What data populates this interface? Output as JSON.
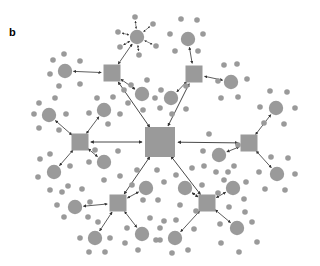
{
  "panel_label": "b",
  "colors": {
    "node": "#9a9a9a",
    "edge": "#333333",
    "background": "#ffffff"
  },
  "diagram": {
    "type": "hierarchical-network",
    "center": {
      "x": 160,
      "y": 142,
      "half": 15
    },
    "hubs": [
      {
        "id": "tl",
        "x": 112,
        "y": 73,
        "half": 8.5
      },
      {
        "id": "tr",
        "x": 194,
        "y": 74,
        "half": 8.5
      },
      {
        "id": "l",
        "x": 80,
        "y": 142,
        "half": 8.5
      },
      {
        "id": "r",
        "x": 249,
        "y": 143,
        "half": 8.5
      },
      {
        "id": "bl",
        "x": 118,
        "y": 203,
        "half": 8.5
      },
      {
        "id": "br",
        "x": 207,
        "y": 203,
        "half": 8.5
      }
    ],
    "clusters": [
      {
        "hub": "tl",
        "x": 137,
        "y": 37,
        "sats": [
          [
            135,
            17
          ],
          [
            153,
            24
          ],
          [
            156,
            46
          ],
          [
            139,
            55
          ],
          [
            120,
            47
          ],
          [
            118,
            32
          ]
        ],
        "arrows": true
      },
      {
        "hub": "tl",
        "x": 65,
        "y": 71,
        "sats": [
          [
            64,
            54
          ],
          [
            80,
            61
          ],
          [
            80,
            84
          ],
          [
            59,
            86
          ],
          [
            50,
            74
          ],
          [
            53,
            60
          ]
        ]
      },
      {
        "hub": "tl",
        "x": 142,
        "y": 94,
        "sats": [
          [
            131,
            85
          ],
          [
            147,
            80
          ],
          [
            155,
            98
          ],
          [
            143,
            110
          ],
          [
            128,
            103
          ],
          [
            124,
            90
          ]
        ]
      },
      {
        "hub": "tr",
        "x": 188,
        "y": 39,
        "sats": [
          [
            181,
            19
          ],
          [
            197,
            20
          ],
          [
            203,
            34
          ],
          [
            198,
            51
          ],
          [
            175,
            51
          ],
          [
            170,
            34
          ]
        ]
      },
      {
        "hub": "tr",
        "x": 231,
        "y": 82,
        "sats": [
          [
            224,
            65
          ],
          [
            237,
            64
          ],
          [
            247,
            79
          ],
          [
            238,
            97
          ],
          [
            221,
            98
          ],
          [
            218,
            81
          ]
        ]
      },
      {
        "hub": "tr",
        "x": 171,
        "y": 98,
        "sats": [
          [
            161,
            90
          ],
          [
            186,
            86
          ],
          [
            186,
            109
          ],
          [
            172,
            114
          ],
          [
            160,
            108
          ]
        ]
      },
      {
        "hub": "l",
        "x": 49,
        "y": 115,
        "sats": [
          [
            39,
            103
          ],
          [
            55,
            98
          ],
          [
            66,
            114
          ],
          [
            59,
            130
          ],
          [
            39,
            128
          ],
          [
            34,
            114
          ]
        ]
      },
      {
        "hub": "l",
        "x": 104,
        "y": 110,
        "sats": [
          [
            97,
            98
          ],
          [
            113,
            97
          ],
          [
            120,
            114
          ],
          [
            108,
            124
          ],
          [
            89,
            113
          ]
        ]
      },
      {
        "hub": "l",
        "x": 54,
        "y": 172,
        "sats": [
          [
            40,
            159
          ],
          [
            50,
            154
          ],
          [
            70,
            166
          ],
          [
            68,
            186
          ],
          [
            50,
            190
          ],
          [
            38,
            177
          ]
        ]
      },
      {
        "hub": "l",
        "x": 104,
        "y": 162,
        "sats": [
          [
            89,
            162
          ],
          [
            95,
            150
          ],
          [
            118,
            151
          ],
          [
            120,
            176
          ],
          [
            104,
            180
          ]
        ]
      },
      {
        "hub": "r",
        "x": 276,
        "y": 108,
        "sats": [
          [
            270,
            91
          ],
          [
            287,
            92
          ],
          [
            295,
            108
          ],
          [
            284,
            124
          ],
          [
            264,
            123
          ],
          [
            260,
            107
          ]
        ]
      },
      {
        "hub": "r",
        "x": 277,
        "y": 174,
        "sats": [
          [
            271,
            157
          ],
          [
            288,
            158
          ],
          [
            295,
            174
          ],
          [
            285,
            190
          ],
          [
            265,
            189
          ],
          [
            259,
            172
          ]
        ]
      },
      {
        "hub": "r",
        "x": 219,
        "y": 155,
        "sats": [
          [
            203,
            151
          ],
          [
            209,
            134
          ],
          [
            238,
            145
          ],
          [
            234,
            166
          ],
          [
            216,
            172
          ],
          [
            204,
            166
          ]
        ]
      },
      {
        "hub": "br",
        "x": 185,
        "y": 188,
        "sats": [
          [
            176,
            175
          ],
          [
            180,
            205
          ],
          [
            196,
            211
          ],
          [
            202,
            185
          ],
          [
            192,
            168
          ]
        ]
      },
      {
        "hub": "br",
        "x": 233,
        "y": 188,
        "sats": [
          [
            228,
            172
          ],
          [
            246,
            182
          ],
          [
            244,
            199
          ],
          [
            229,
            207
          ],
          [
            218,
            193
          ],
          [
            224,
            180
          ]
        ]
      },
      {
        "hub": "br",
        "x": 175,
        "y": 238,
        "sats": [
          [
            164,
            221
          ],
          [
            176,
            220
          ],
          [
            194,
            229
          ],
          [
            188,
            250
          ],
          [
            172,
            253
          ],
          [
            160,
            240
          ]
        ]
      },
      {
        "hub": "br",
        "x": 237,
        "y": 228,
        "sats": [
          [
            220,
            224
          ],
          [
            221,
            243
          ],
          [
            239,
            252
          ],
          [
            257,
            242
          ],
          [
            252,
            222
          ],
          [
            245,
            212
          ]
        ]
      },
      {
        "hub": "bl",
        "x": 146,
        "y": 188,
        "sats": [
          [
            132,
            185
          ],
          [
            137,
            170
          ],
          [
            157,
            170
          ],
          [
            158,
            200
          ],
          [
            143,
            200
          ],
          [
            164,
            182
          ]
        ]
      },
      {
        "hub": "bl",
        "x": 75,
        "y": 207,
        "sats": [
          [
            62,
            192
          ],
          [
            82,
            189
          ],
          [
            90,
            202
          ],
          [
            88,
            217
          ],
          [
            64,
            217
          ],
          [
            57,
            205
          ]
        ]
      },
      {
        "hub": "bl",
        "x": 95,
        "y": 238,
        "sats": [
          [
            80,
            238
          ],
          [
            89,
            252
          ],
          [
            105,
            252
          ],
          [
            110,
            238
          ],
          [
            98,
            222
          ]
        ]
      },
      {
        "hub": "bl",
        "x": 142,
        "y": 234,
        "sats": [
          [
            127,
            228
          ],
          [
            125,
            243
          ],
          [
            138,
            250
          ],
          [
            156,
            240
          ],
          [
            160,
            228
          ],
          [
            150,
            218
          ]
        ]
      }
    ]
  }
}
